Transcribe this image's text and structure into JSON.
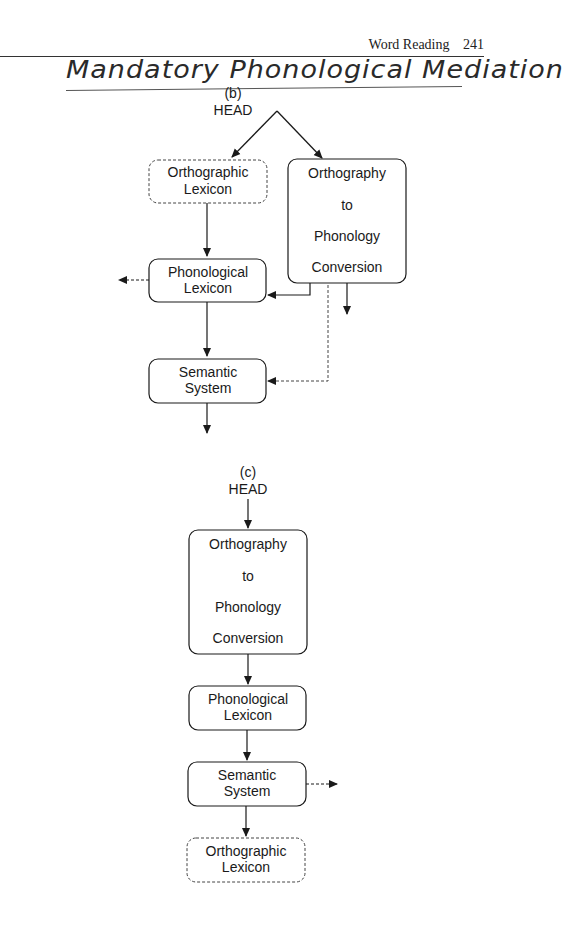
{
  "page": {
    "running_head": "Word Reading",
    "page_number": "241",
    "handwritten_note": "Mandatory Phonological Mediation"
  },
  "diagram_b": {
    "label": "(b)",
    "source": "HEAD",
    "nodes": {
      "orthographic_lexicon": {
        "lines": [
          "Orthographic",
          "Lexicon"
        ],
        "style": "dashed"
      },
      "opc": {
        "lines": [
          "Orthography",
          "to",
          "Phonology",
          "Conversion"
        ],
        "style": "solid"
      },
      "phonological_lexicon": {
        "lines": [
          "Phonological",
          "Lexicon"
        ],
        "style": "solid"
      },
      "semantic_system": {
        "lines": [
          "Semantic",
          "System"
        ],
        "style": "solid"
      }
    }
  },
  "diagram_c": {
    "label": "(c)",
    "source": "HEAD",
    "nodes": {
      "opc": {
        "lines": [
          "Orthography",
          "to",
          "Phonology",
          "Conversion"
        ],
        "style": "solid"
      },
      "phonological_lexicon": {
        "lines": [
          "Phonological",
          "Lexicon"
        ],
        "style": "solid"
      },
      "semantic_system": {
        "lines": [
          "Semantic",
          "System"
        ],
        "style": "solid"
      },
      "orthographic_lexicon": {
        "lines": [
          "Orthographic",
          "Lexicon"
        ],
        "style": "dashed"
      }
    }
  }
}
